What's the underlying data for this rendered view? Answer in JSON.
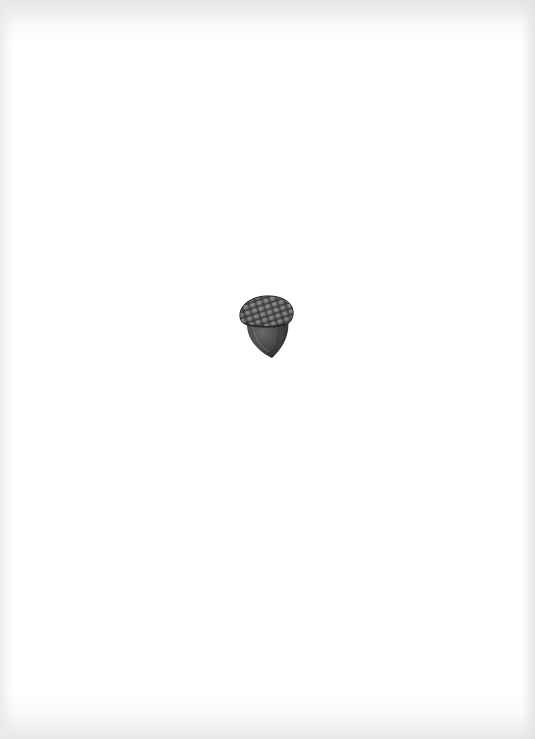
{
  "page": {
    "background": "#ffffff",
    "edge_shade": "#e2e2e2"
  },
  "illustration": {
    "subject": "acorn",
    "icon": "acorn-icon",
    "style": "grayscale pencil drawing",
    "colors": {
      "cap_dark": "#3a3a3a",
      "cap_scale": "#6e6e6e",
      "cap_highlight": "#8c8c8c",
      "nut_dark": "#2e2e2e",
      "nut_mid": "#505050",
      "nut_highlight": "#707070"
    }
  }
}
